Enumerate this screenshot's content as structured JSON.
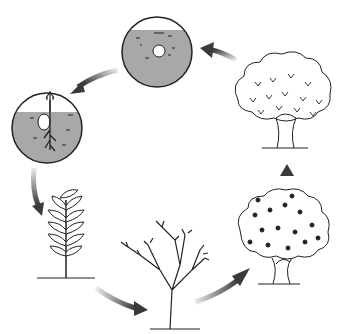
{
  "diagram": {
    "title": "",
    "type": "cycle",
    "stages": [
      {
        "id": "seed",
        "name": "Seed in soil",
        "icon": "seed-in-soil-icon"
      },
      {
        "id": "germination",
        "name": "Germinating seed",
        "icon": "germinating-seed-icon"
      },
      {
        "id": "seedling",
        "name": "Young plant",
        "icon": "young-plant-icon"
      },
      {
        "id": "sapling",
        "name": "Sapling",
        "icon": "sapling-icon"
      },
      {
        "id": "tree",
        "name": "Growing tree",
        "icon": "growing-tree-icon"
      },
      {
        "id": "mature",
        "name": "Mature tree",
        "icon": "mature-tree-icon"
      }
    ],
    "colors": {
      "arrow": "#3a3a3a",
      "soil": "#a8a8a8",
      "line": "#222222",
      "background": "#ffffff"
    }
  }
}
